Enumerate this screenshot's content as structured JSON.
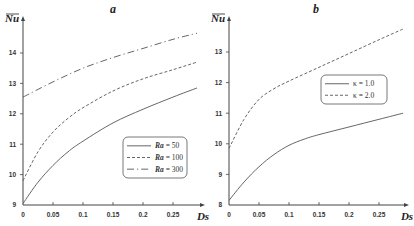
{
  "chart_data": [
    {
      "type": "line",
      "panel": "a",
      "title": "a",
      "xlabel": "Ds",
      "ylabel": "Nu (overbar)",
      "xlim": [
        0,
        0.29
      ],
      "ylim": [
        9,
        14.8
      ],
      "xticks": [
        0,
        0.05,
        0.1,
        0.15,
        0.2,
        0.25
      ],
      "xtick_labels": [
        "0",
        "0.05",
        "0.1",
        "0.15",
        "0.2",
        "0.25"
      ],
      "yticks": [
        9,
        10,
        11,
        12,
        13,
        14
      ],
      "ytick_labels": [
        "9",
        "10",
        "11",
        "12",
        "13",
        "14"
      ],
      "grid": false,
      "legend_position": "lower right",
      "series": [
        {
          "name": "Ra = 50",
          "param": "Ra",
          "value": "50",
          "style": "solid",
          "x": [
            0,
            0.025,
            0.05,
            0.075,
            0.1,
            0.15,
            0.2,
            0.25,
            0.29
          ],
          "y": [
            9.05,
            9.75,
            10.3,
            10.75,
            11.1,
            11.7,
            12.15,
            12.55,
            12.85
          ]
        },
        {
          "name": "Ra = 100",
          "param": "Ra",
          "value": "100",
          "style": "dashed",
          "x": [
            0,
            0.025,
            0.05,
            0.075,
            0.1,
            0.15,
            0.2,
            0.25,
            0.29
          ],
          "y": [
            9.8,
            10.75,
            11.4,
            11.85,
            12.2,
            12.75,
            13.15,
            13.45,
            13.7
          ]
        },
        {
          "name": "Ra = 300",
          "param": "Ra",
          "value": "300",
          "style": "dashdot",
          "x": [
            0,
            0.05,
            0.1,
            0.15,
            0.2,
            0.25,
            0.29
          ],
          "y": [
            12.55,
            13.05,
            13.5,
            13.85,
            14.15,
            14.45,
            14.65
          ]
        }
      ]
    },
    {
      "type": "line",
      "panel": "b",
      "title": "b",
      "xlabel": "Ds",
      "ylabel": "Nu (overbar)",
      "xlim": [
        0,
        0.29
      ],
      "ylim": [
        8,
        13.8
      ],
      "xticks": [
        0,
        0.05,
        0.1,
        0.15,
        0.2,
        0.25
      ],
      "xtick_labels": [
        "0",
        "0.05",
        "0.1",
        "0.15",
        "0.2",
        "0.25"
      ],
      "yticks": [
        8,
        9,
        10,
        11,
        12,
        13
      ],
      "ytick_labels": [
        "8",
        "9",
        "10",
        "11",
        "12",
        "13"
      ],
      "grid": false,
      "legend_position": "center right",
      "series": [
        {
          "name": "κ = 1.0",
          "param": "κ",
          "value": "1.0",
          "style": "solid",
          "x": [
            0,
            0.025,
            0.05,
            0.075,
            0.1,
            0.125,
            0.15,
            0.2,
            0.25,
            0.29
          ],
          "y": [
            8.15,
            8.75,
            9.25,
            9.65,
            9.95,
            10.15,
            10.3,
            10.55,
            10.8,
            11.0
          ]
        },
        {
          "name": "κ = 2.0",
          "param": "κ",
          "value": "2.0",
          "style": "dashed",
          "x": [
            0,
            0.025,
            0.05,
            0.075,
            0.1,
            0.15,
            0.2,
            0.25,
            0.29
          ],
          "y": [
            9.85,
            10.8,
            11.45,
            11.8,
            12.05,
            12.5,
            12.95,
            13.4,
            13.75
          ]
        }
      ]
    }
  ],
  "panels": {
    "a": {
      "title": "a",
      "y_axis_symbol": "Nu",
      "x_axis_symbol": "Ds"
    },
    "b": {
      "title": "b",
      "y_axis_symbol": "Nu",
      "x_axis_symbol": "Ds"
    }
  },
  "style": {
    "line_color": "#555555",
    "axis_color": "#444444",
    "text_color": "#222222",
    "legend_border": "#555555"
  }
}
